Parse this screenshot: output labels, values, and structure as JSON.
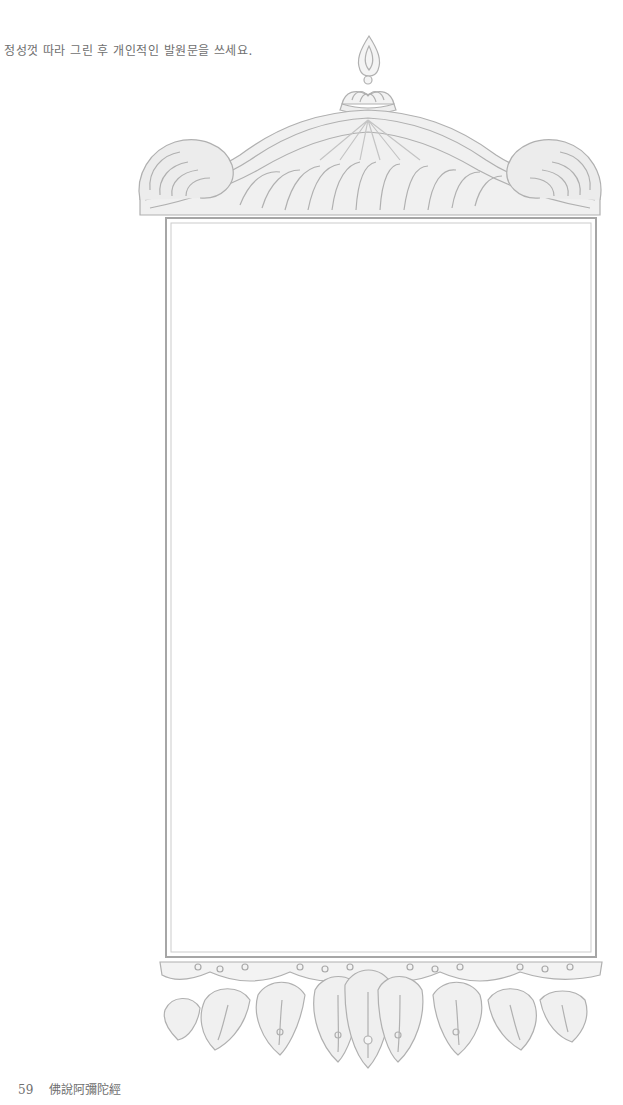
{
  "page": {
    "instruction": "정성껏 따라 그린 후 개인적인 발원문을 쓰세요.",
    "footer": {
      "page_number": "59",
      "title": "佛說阿彌陀經"
    }
  },
  "illustration": {
    "description": "Ornamental tracing frame with flame finial, scrolling canopy top and lotus-petal base",
    "line_color": "#a9a9a9",
    "writing_area": "blank"
  }
}
